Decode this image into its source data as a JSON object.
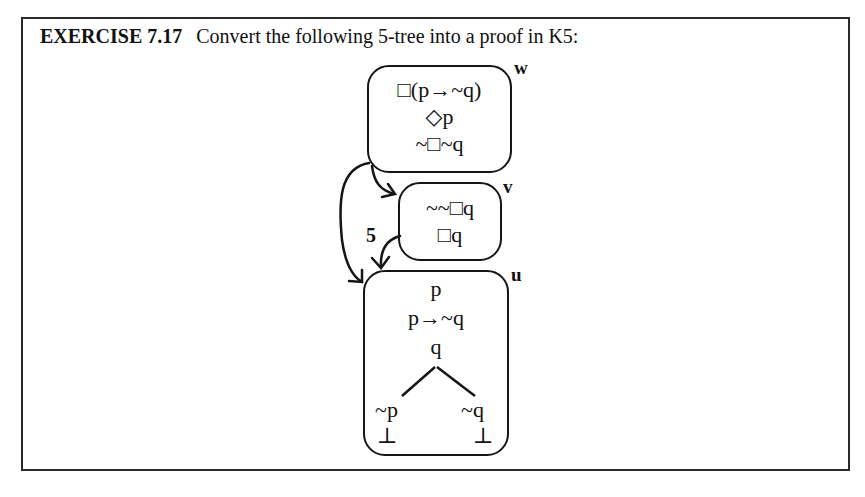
{
  "exercise": {
    "number": "EXERCISE 7.17",
    "instruction": "Convert the following 5-tree into a proof in K5:"
  },
  "tree": {
    "worlds": {
      "w": {
        "label": "w",
        "lines": [
          "□(p→~q)",
          "◇p",
          "~□~q"
        ]
      },
      "v": {
        "label": "v",
        "lines": [
          "~~□q",
          "□q"
        ]
      },
      "u": {
        "label": "u",
        "lines": [
          "p",
          "p→~q",
          "q"
        ],
        "branches": [
          {
            "formula": "~p",
            "closure": "⊥"
          },
          {
            "formula": "~q",
            "closure": "⊥"
          }
        ]
      }
    },
    "arrows": [
      {
        "from": "w",
        "to": "v",
        "label": ""
      },
      {
        "from": "w",
        "to": "u",
        "label": ""
      },
      {
        "from": "v",
        "to": "u",
        "label": "5"
      }
    ]
  }
}
